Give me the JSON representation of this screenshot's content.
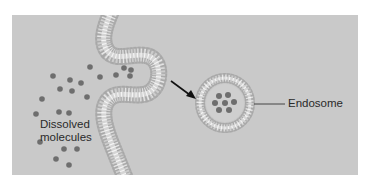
{
  "diagram": {
    "colors": {
      "background": "#ffffff",
      "panel": "#c9c9c9",
      "molecule": "#6e6e6e",
      "membrane_head": "#b4b4b4",
      "membrane_core": "#e8e8e8",
      "arrow": "#111111",
      "leader_line": "#444444",
      "text": "#2a2a2a"
    },
    "labels": {
      "dissolved_molecules_line1": "Dissolved",
      "dissolved_molecules_line2": "molecules",
      "endosome": "Endosome"
    },
    "molecules_outside": [
      [
        90,
        67
      ],
      [
        53,
        76
      ],
      [
        70,
        80
      ],
      [
        81,
        83
      ],
      [
        60,
        89
      ],
      [
        72,
        91
      ],
      [
        87,
        97
      ],
      [
        42,
        99
      ],
      [
        36,
        114
      ],
      [
        59,
        112
      ],
      [
        69,
        113
      ],
      [
        40,
        142
      ],
      [
        64,
        149
      ],
      [
        77,
        149
      ],
      [
        56,
        159
      ],
      [
        69,
        165
      ],
      [
        100,
        77
      ],
      [
        116,
        75
      ],
      [
        124,
        68
      ],
      [
        131,
        70
      ],
      [
        130,
        76
      ]
    ],
    "molecules_in_endosome": [
      [
        219,
        96
      ],
      [
        228,
        95
      ],
      [
        215,
        103
      ],
      [
        225,
        103
      ],
      [
        234,
        102
      ],
      [
        219,
        110
      ],
      [
        229,
        110
      ]
    ],
    "endosome": {
      "cx": 225,
      "cy": 103,
      "r_outer": 29,
      "r_inner": 17
    }
  }
}
